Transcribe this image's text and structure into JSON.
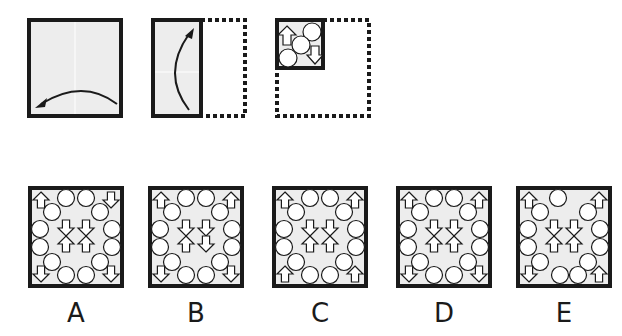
{
  "puzzle": {
    "type": "paper-folding-punch",
    "steps": [
      {
        "id": 1,
        "description": "Full square sheet, fold right half over to left",
        "arrow": "curved-right-to-left"
      },
      {
        "id": 2,
        "description": "Folded half sheet, fold bottom up to top",
        "arrow": "curved-bottom-to-top"
      },
      {
        "id": 3,
        "description": "Quarter sheet with punched shapes",
        "marks": [
          {
            "shape": "arrow-up",
            "pos": "top-left"
          },
          {
            "shape": "circle",
            "pos": "top-right"
          },
          {
            "shape": "circle",
            "pos": "center"
          },
          {
            "shape": "circle",
            "pos": "bottom-left"
          },
          {
            "shape": "arrow-down",
            "pos": "bottom-right"
          }
        ]
      }
    ]
  },
  "options": [
    {
      "label": "A",
      "corners": [
        "up",
        "down",
        "down",
        "down"
      ],
      "center": [
        "down",
        "down",
        "up",
        "up"
      ],
      "circles": 14
    },
    {
      "label": "B",
      "corners": [
        "up",
        "up",
        "down",
        "down"
      ],
      "center": [
        "down",
        "down",
        "up",
        "down"
      ],
      "circles": 14
    },
    {
      "label": "C",
      "corners": [
        "up",
        "up",
        "up",
        "up"
      ],
      "center": [
        "down",
        "down",
        "up",
        "up"
      ],
      "circles": 14
    },
    {
      "label": "D",
      "corners": [
        "up",
        "up",
        "down",
        "down"
      ],
      "center": [
        "down",
        "down",
        "up",
        "up"
      ],
      "circles": 14
    },
    {
      "label": "E",
      "corners": [
        "up",
        "up",
        "down",
        "up"
      ],
      "center": [
        "down",
        "down",
        "up",
        "up"
      ],
      "circles": 12
    }
  ],
  "colors": {
    "border": "#1a1a1a",
    "fill": "#ededed",
    "shape_fill": "#ffffff"
  }
}
